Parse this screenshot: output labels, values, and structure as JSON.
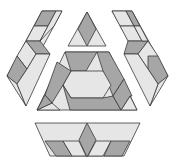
{
  "figure": {
    "title": "Hexagonal tessellation pattern",
    "width": 174,
    "height": 163
  },
  "colors": {
    "dark": "#a6a6a6",
    "light": "#e6e6e6",
    "white": "#ffffff",
    "stroke": "#3a3a3a"
  },
  "regions": [
    {
      "name": "left-band",
      "tiles": [
        {
          "shade": "light",
          "points": "42,11 62,11 27,76 7,76"
        },
        {
          "shade": "dark",
          "points": "42,11 56,11 48,26 34,26"
        },
        {
          "shade": "light",
          "points": "34,26 48,26 40,41 26,41"
        },
        {
          "shade": "dark",
          "points": "26,41 40,41 50,54 36,54"
        },
        {
          "shade": "light",
          "points": "40,41 54,26 62,11 56,11 48,26"
        },
        {
          "shade": "light",
          "points": "26,41 36,54 27,69 17,56"
        },
        {
          "shade": "dark",
          "points": "17,56 27,69 17,84 7,76"
        },
        {
          "shade": "light",
          "points": "7,76 17,84 26,106"
        },
        {
          "shade": "light",
          "points": "36,54 50,54 26,106 17,84 27,69"
        }
      ]
    },
    {
      "name": "right-band",
      "tiles": [
        {
          "shade": "light",
          "points": "112,11 132,11 168,76 148,76"
        },
        {
          "shade": "light",
          "points": "112,11 126,11 134,26 120,26"
        },
        {
          "shade": "dark",
          "points": "126,11 132,11 140,26 134,26"
        },
        {
          "shade": "light",
          "points": "120,26 134,26 142,41 128,41"
        },
        {
          "shade": "dark",
          "points": "124,54 138,54 148,41 134,41 128,41"
        },
        {
          "shade": "light",
          "points": "134,26 140,26 148,41 142,41"
        },
        {
          "shade": "light",
          "points": "138,54 148,41 158,56 148,69"
        },
        {
          "shade": "dark",
          "points": "148,56 158,56 168,76 158,84 148,69"
        },
        {
          "shade": "light",
          "points": "158,84 168,76 150,106"
        },
        {
          "shade": "light",
          "points": "124,54 138,54 148,69 158,84 150,106"
        }
      ]
    },
    {
      "name": "top-triangle",
      "tiles": [
        {
          "shade": "light",
          "points": "87,12 106,46 68,46"
        },
        {
          "shade": "dark",
          "points": "87,12 96,29 87,46 78,29"
        }
      ]
    },
    {
      "name": "central-triangle",
      "tiles": [
        {
          "shade": "light",
          "points": "65,52 109,52 137,110 37,110"
        },
        {
          "shade": "dark",
          "points": "65,52 97,52 86,71 71,71"
        },
        {
          "shade": "dark",
          "points": "97,52 109,52 124,79 113,96 103,71"
        },
        {
          "shade": "light",
          "points": "71,71 86,71 103,71 111,85 103,98 71,98 63,85"
        },
        {
          "shade": "dark",
          "points": "57,62 71,71 63,85 52,103 45,95"
        },
        {
          "shade": "dark",
          "points": "63,85 71,98 103,98 113,96 121,110 83,110 70,110"
        },
        {
          "shade": "light",
          "points": "37,110 52,103 60,110"
        },
        {
          "shade": "dark",
          "points": "37,110 45,95 52,103"
        },
        {
          "shade": "light",
          "points": "121,110 130,96 137,110"
        },
        {
          "shade": "dark",
          "points": "113,96 124,79 132,96 130,96 121,110"
        }
      ]
    },
    {
      "name": "bottom-trapezoid",
      "tiles": [
        {
          "shade": "light",
          "points": "35,123 140,123 124,156 50,156"
        },
        {
          "shade": "dark",
          "points": "45,141 63,141 72,156 56,156"
        },
        {
          "shade": "light",
          "points": "63,141 79,141 86,156 72,156"
        },
        {
          "shade": "dark",
          "points": "87,123 96,140 87,157 79,140"
        },
        {
          "shade": "light",
          "points": "96,141 111,141 103,156 88,156"
        },
        {
          "shade": "dark",
          "points": "111,141 130,141 122,156 104,156"
        }
      ]
    }
  ]
}
